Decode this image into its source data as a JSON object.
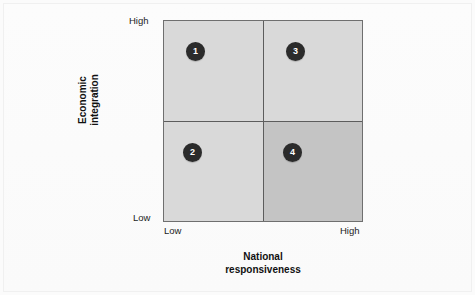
{
  "figure": {
    "background_color": "#fbfbfb",
    "plot_background_color": "#d9d9d9",
    "highlight_quadrant_color": "#c4c4c4",
    "marker_color": "#2b2b2b",
    "marker_text_color": "#ffffff",
    "line_color": "#5d5d5d"
  },
  "axes": {
    "y": {
      "title_line1": "Economic",
      "title_line2": "integration",
      "tick_high": "High",
      "tick_low": "Low"
    },
    "x": {
      "title_line1": "National",
      "title_line2": "responsiveness",
      "tick_low": "Low",
      "tick_high": "High"
    }
  },
  "markers": [
    {
      "label": "1",
      "quadrant": "high-economic-integration-low-national-responsiveness"
    },
    {
      "label": "2",
      "quadrant": "low-economic-integration-low-national-responsiveness"
    },
    {
      "label": "3",
      "quadrant": "high-economic-integration-high-national-responsiveness"
    },
    {
      "label": "4",
      "quadrant": "low-economic-integration-high-national-responsiveness"
    }
  ],
  "chart_data": {
    "type": "scatter",
    "title": "",
    "xlabel": "National responsiveness",
    "ylabel": "Economic integration",
    "xlim": [
      0,
      1
    ],
    "ylim": [
      0,
      1
    ],
    "xticklabels": [
      "Low",
      "High"
    ],
    "yticklabels": [
      "Low",
      "High"
    ],
    "grid": false,
    "legend": "none",
    "quadrants": [
      {
        "id": 1,
        "x": "low",
        "y": "high",
        "shade": "#d9d9d9"
      },
      {
        "id": 3,
        "x": "high",
        "y": "high",
        "shade": "#d9d9d9"
      },
      {
        "id": 2,
        "x": "low",
        "y": "low",
        "shade": "#d9d9d9"
      },
      {
        "id": 4,
        "x": "high",
        "y": "low",
        "shade": "#c4c4c4"
      }
    ],
    "points": [
      {
        "label": "1",
        "x": 0.16,
        "y": 0.85
      },
      {
        "label": "3",
        "x": 0.66,
        "y": 0.85
      },
      {
        "label": "2",
        "x": 0.14,
        "y": 0.35
      },
      {
        "label": "4",
        "x": 0.64,
        "y": 0.35
      }
    ],
    "annotations": [
      "1",
      "2",
      "3",
      "4"
    ]
  }
}
